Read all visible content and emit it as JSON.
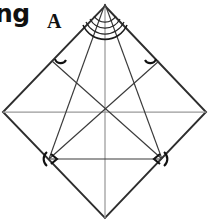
{
  "figure": {
    "cropped_word": "ng",
    "vertex_label_a": "A",
    "colors": {
      "stroke_outline": "#2e2e2e",
      "stroke_line": "#3a3a3a",
      "stroke_faint": "#9a9a9a",
      "angle_mark": "#111111",
      "background": "#ffffff"
    },
    "canvas": {
      "width": 211,
      "height": 221
    },
    "points": {
      "apex": {
        "x": 105,
        "y": 4
      },
      "square_top": {
        "x": 105,
        "y": 6
      },
      "square_left": {
        "x": 3,
        "y": 112
      },
      "square_right": {
        "x": 206,
        "y": 112
      },
      "square_bottom": {
        "x": 105,
        "y": 218
      },
      "base_left": {
        "x": 49,
        "y": 159
      },
      "base_right": {
        "x": 162,
        "y": 159
      },
      "center": {
        "x": 105,
        "y": 112
      }
    },
    "elements": [
      {
        "name": "square-outline",
        "kind": "polygon",
        "description": "square rotated 45 degrees forming a diamond"
      },
      {
        "name": "apex-to-base-left",
        "kind": "segment"
      },
      {
        "name": "apex-to-base-right",
        "kind": "segment"
      },
      {
        "name": "base-line",
        "kind": "segment",
        "description": "horizontal base of inner triangle"
      },
      {
        "name": "diagonal-left",
        "kind": "segment",
        "description": "square diagonal from left vertex to right vertex"
      },
      {
        "name": "vertical-axis",
        "kind": "segment",
        "description": "axis of symmetry from top to bottom vertex"
      },
      {
        "name": "base-left-to-square-right-upper",
        "kind": "segment"
      },
      {
        "name": "base-right-to-square-left-upper",
        "kind": "segment"
      }
    ],
    "angle_marks": {
      "apex_arcs": {
        "count": 4,
        "description": "nested arcs at apex marking equal divided angles"
      },
      "upper_edge_ticks": {
        "count": 2,
        "description": "small arc marks on the upper-left and upper-right square edges"
      },
      "base_angle_marks": {
        "count": 2,
        "description": "arrow-style angle marks at the two base vertices"
      }
    }
  }
}
